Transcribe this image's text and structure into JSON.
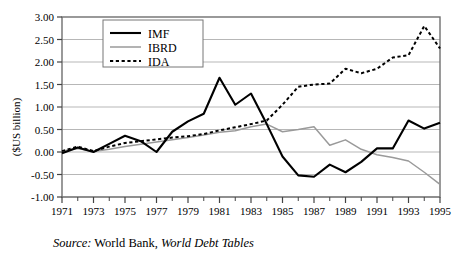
{
  "figure": {
    "ylabel": "($US billion)",
    "source_prefix": "Source:",
    "source_org": " World Bank, ",
    "source_publication": "World Debt Tables"
  },
  "legend": {
    "position": "top-left-inside",
    "entries": [
      {
        "label": "IMF",
        "style": "solid-thick",
        "color": "#000000"
      },
      {
        "label": "IBRD",
        "style": "solid-thin",
        "color": "#9a9a9a"
      },
      {
        "label": "IDA",
        "style": "dotted",
        "color": "#000000"
      }
    ]
  },
  "chart_data": {
    "type": "line",
    "title": "",
    "xlabel": "",
    "ylabel": "($US billion)",
    "xlim": [
      1971,
      1995
    ],
    "ylim": [
      -1.0,
      3.0
    ],
    "yticks": [
      -1.0,
      -0.5,
      0.0,
      0.5,
      1.0,
      1.5,
      2.0,
      2.5,
      3.0
    ],
    "ytick_labels": [
      "-1.00",
      "-0.50",
      "0.00",
      "0.50",
      "1.00",
      "1.50",
      "2.00",
      "2.50",
      "3.00"
    ],
    "x": [
      1971,
      1972,
      1973,
      1974,
      1975,
      1976,
      1977,
      1978,
      1979,
      1980,
      1981,
      1982,
      1983,
      1984,
      1985,
      1986,
      1987,
      1988,
      1989,
      1990,
      1991,
      1992,
      1993,
      1994,
      1995
    ],
    "xtick_labels": [
      "1971",
      "1973",
      "1975",
      "1977",
      "1979",
      "1981",
      "1983",
      "1985",
      "1987",
      "1989",
      "1991",
      "1993",
      "1995"
    ],
    "xticks_major": [
      1971,
      1973,
      1975,
      1977,
      1979,
      1981,
      1983,
      1985,
      1987,
      1989,
      1991,
      1993,
      1995
    ],
    "grid": "horizontal",
    "legend_position": "upper left",
    "series": [
      {
        "name": "IMF",
        "color": "#000000",
        "style": "solid-thick",
        "values": [
          -0.03,
          0.1,
          0.0,
          0.18,
          0.36,
          0.24,
          0.0,
          0.45,
          0.68,
          0.85,
          1.65,
          1.05,
          1.3,
          0.62,
          -0.1,
          -0.52,
          -0.55,
          -0.28,
          -0.45,
          -0.22,
          0.08,
          0.08,
          0.7,
          0.52,
          0.65
        ]
      },
      {
        "name": "IBRD",
        "color": "#9a9a9a",
        "style": "solid-thin",
        "values": [
          0.02,
          0.08,
          0.01,
          0.06,
          0.12,
          0.17,
          0.22,
          0.27,
          0.32,
          0.38,
          0.44,
          0.47,
          0.56,
          0.62,
          0.45,
          0.5,
          0.56,
          0.15,
          0.27,
          0.06,
          -0.06,
          -0.12,
          -0.2,
          -0.45,
          -0.72
        ]
      },
      {
        "name": "IDA",
        "color": "#000000",
        "style": "dotted",
        "values": [
          0.02,
          0.12,
          0.02,
          0.12,
          0.2,
          0.24,
          0.28,
          0.32,
          0.35,
          0.4,
          0.48,
          0.55,
          0.62,
          0.7,
          1.05,
          1.45,
          1.5,
          1.52,
          1.85,
          1.75,
          1.85,
          2.1,
          2.15,
          2.8,
          2.3
        ]
      }
    ]
  }
}
